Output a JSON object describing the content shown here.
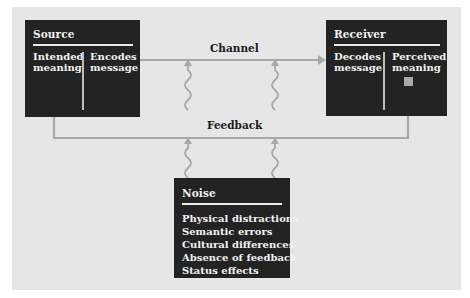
{
  "diagram": {
    "type": "communication-process-model",
    "source": {
      "title": "Source",
      "cells": [
        "Intended\nmeaning",
        "Encodes\nmessage"
      ]
    },
    "receiver": {
      "title": "Receiver",
      "cells": [
        "Decodes\nmessage",
        "Perceived\nmeaning"
      ]
    },
    "channel_label": "Channel",
    "feedback_label": "Feedback",
    "noise": {
      "title": "Noise",
      "items": [
        "Physical distractions",
        "Semantic errors",
        "Cultural differences",
        "Absence of feedback",
        "Status effects"
      ]
    },
    "colors": {
      "panel": "#e6e6e6",
      "box": "#232323",
      "box_text": "#f2f2f2",
      "connector": "#a8a8a8",
      "label_text": "#1a1a1a"
    }
  }
}
